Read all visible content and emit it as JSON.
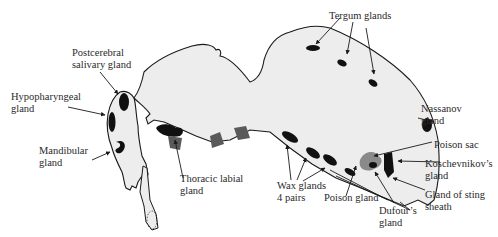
{
  "figure": {
    "colors": {
      "body_fill": "#ededed",
      "outline": "#1a1a1a",
      "gland_dark": "#111111",
      "gland_gray": "#5a5a5a",
      "poison_sac": "#8a8a8a",
      "text": "#2a2a2a"
    }
  },
  "labels": {
    "postcerebral": [
      "Postcerebral",
      "salivary gland"
    ],
    "hypopharyngeal": [
      "Hypopharyngeal",
      "gland"
    ],
    "mandibular": [
      "Mandibular",
      "gland"
    ],
    "thoracic_labial": [
      "Thoracic labial",
      "gland"
    ],
    "tergum": [
      "Tergum glands"
    ],
    "nassanov": [
      "Nassanov",
      "gland"
    ],
    "poison_sac": [
      "Poison sac"
    ],
    "koschevnikov": [
      "Koschevnikov’s",
      "gland"
    ],
    "gland_sting_sheath": [
      "Gland of sting",
      "sheath"
    ],
    "wax": [
      "Wax glands",
      "4 pairs"
    ],
    "poison_gland": [
      "Poison gland"
    ],
    "dufour": [
      "Dufour’s",
      "gland"
    ]
  }
}
